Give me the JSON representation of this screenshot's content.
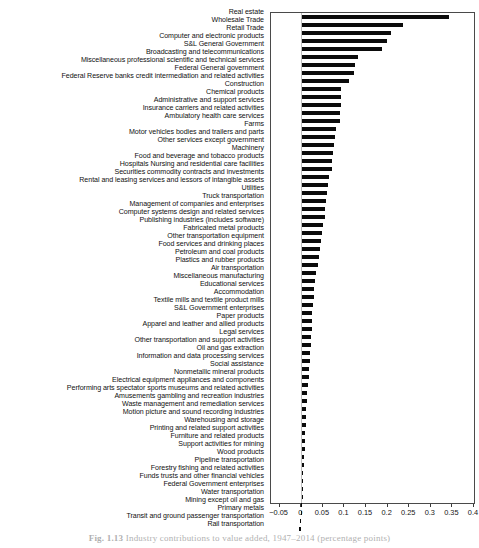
{
  "figure": {
    "caption_label": "Fig. 1.13",
    "caption_text": "Industry contributions to value added, 1947–2014 (percentage points)"
  },
  "chart_data": {
    "type": "bar",
    "orientation": "horizontal",
    "title": "",
    "xlabel": "",
    "ylabel": "",
    "xlim": [
      -0.07,
      0.4
    ],
    "grid": false,
    "legend": "none",
    "xticks": [
      -0.05,
      0,
      0.05,
      0.1,
      0.15,
      0.2,
      0.25,
      0.3,
      0.35,
      0.4
    ],
    "xticklabels": [
      "−0.05",
      "0",
      "0.05",
      "0.1",
      "0.15",
      "0.2",
      "0.25",
      "0.3",
      "0.35",
      "0.4"
    ],
    "categories": [
      "Real estate",
      "Wholesale Trade",
      "Retail Trade",
      "Computer and electronic products",
      "S&L General Government",
      "Broadcasting and telecommunications",
      "Miscellaneous professional scientific and technical services",
      "Federal General government",
      "Federal Reserve banks credit intermediation and related activities",
      "Construction",
      "Chemical products",
      "Administrative and support services",
      "Insurance carriers and related activities",
      "Ambulatory health care services",
      "Farms",
      "Motor vehicles bodies and trailers and parts",
      "Other services except government",
      "Machinery",
      "Food and beverage and tobacco products",
      "Hospitals Nursing and residential care facilities",
      "Securities  commodity contracts  and investments",
      "Rental and leasing services and lessors of intangible assets",
      "Utilities",
      "Truck transportation",
      "Management of companies and enterprises",
      "Computer systems design and related services",
      "Publishing industries (includes software)",
      "Fabricated metal products",
      "Other transportation equipment",
      "Food services and drinking places",
      "Petroleum and coal products",
      "Plastics and rubber products",
      "Air transportation",
      "Miscellaneous manufacturing",
      "Educational services",
      "Accommodation",
      "Textile mills and textile product mills",
      "S&L Government enterprises",
      "Paper products",
      "Apparel and leather and allied products",
      "Legal services",
      "Other transportation and support activities",
      "Oil and gas extraction",
      "Information and data processing services",
      "Social assistance",
      "Nonmetallic mineral products",
      "Electrical equipment appliances and components",
      "Performing arts spectator sports museums and related activities",
      "Amusements gambling and recreation industries",
      "Waste management and remediation services",
      "Motion picture and sound recording industries",
      "Warehousing and storage",
      "Printing and related support activities",
      "Furniture and related products",
      "Support activities for mining",
      "Wood products",
      "Pipeline transportation",
      "Forestry  fishing  and related activities",
      "Funds  trusts  and other financial vehicles",
      "Federal Government enterprises",
      "Water transportation",
      "Mining  except oil and gas",
      "Primary metals",
      "Transit and ground passenger transportation",
      "Rail transportation"
    ],
    "values": [
      0.341,
      0.236,
      0.209,
      0.198,
      0.186,
      0.131,
      0.124,
      0.123,
      0.11,
      0.093,
      0.092,
      0.092,
      0.09,
      0.089,
      0.081,
      0.078,
      0.076,
      0.073,
      0.072,
      0.071,
      0.065,
      0.062,
      0.059,
      0.058,
      0.056,
      0.054,
      0.051,
      0.049,
      0.046,
      0.044,
      0.041,
      0.038,
      0.035,
      0.032,
      0.03,
      0.029,
      0.027,
      0.026,
      0.025,
      0.024,
      0.023,
      0.022,
      0.021,
      0.02,
      0.018,
      0.017,
      0.015,
      0.014,
      0.013,
      0.012,
      0.011,
      0.01,
      0.009,
      0.009,
      0.008,
      0.007,
      0.006,
      0.005,
      0.004,
      0.004,
      0.003,
      0.002,
      -0.001,
      -0.004,
      -0.006
    ]
  }
}
